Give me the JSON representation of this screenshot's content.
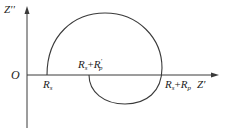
{
  "diagram": {
    "type": "nyquist-impedance-plot",
    "axes": {
      "x_label": "Z'",
      "y_label": "Z''",
      "origin_label": "O"
    },
    "points": [
      {
        "id": "rs",
        "label_main": "R",
        "label_sub": "s"
      },
      {
        "id": "rs-rp-prime",
        "label_main": "R",
        "label_sub": "s",
        "plus": "+",
        "label_main2": "R",
        "label_sub2": "p",
        "prime": "′"
      },
      {
        "id": "rs-rp",
        "label_main": "R",
        "label_sub": "s",
        "plus": "+",
        "label_main2": "R",
        "label_sub2": "p"
      }
    ],
    "colors": {
      "line": "#3a3a3a",
      "text": "#222222",
      "background": "#ffffff"
    }
  }
}
